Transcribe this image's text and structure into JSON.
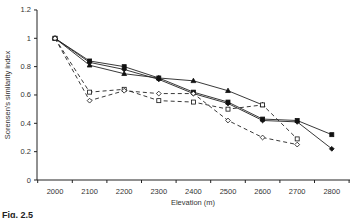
{
  "chart_data": {
    "type": "line",
    "title": "",
    "xlabel": "Elevation (m)",
    "ylabel": "Sorensen's similarity index",
    "x": [
      2000,
      2100,
      2200,
      2300,
      2400,
      2500,
      2600,
      2700,
      2800
    ],
    "xticks": [
      "2000",
      "2100",
      "2200",
      "2300",
      "2400",
      "2500",
      "2600",
      "2700",
      "2800"
    ],
    "yticks": [
      "0",
      "0.2",
      "0.4",
      "0.6",
      "0.8",
      "1",
      "1.2"
    ],
    "ylim": [
      0,
      1.2
    ],
    "grid": false,
    "legend": "none",
    "series": [
      {
        "name": "filled-square",
        "marker": "square",
        "filled": true,
        "dashed": false,
        "values": [
          1.0,
          0.84,
          0.8,
          0.72,
          0.62,
          0.55,
          0.43,
          0.42,
          0.32
        ]
      },
      {
        "name": "filled-diamond",
        "marker": "diamond",
        "filled": true,
        "dashed": false,
        "values": [
          1.0,
          0.83,
          0.78,
          0.71,
          0.61,
          0.54,
          0.42,
          0.41,
          0.22
        ]
      },
      {
        "name": "filled-triangle",
        "marker": "triangle",
        "filled": true,
        "dashed": false,
        "values": [
          1.0,
          0.81,
          0.75,
          0.72,
          0.7,
          0.63,
          0.53,
          null,
          null
        ]
      },
      {
        "name": "open-square",
        "marker": "square",
        "filled": false,
        "dashed": true,
        "values": [
          1.0,
          0.62,
          0.64,
          0.56,
          0.55,
          0.5,
          0.53,
          0.29,
          null
        ]
      },
      {
        "name": "open-diamond",
        "marker": "diamond",
        "filled": false,
        "dashed": true,
        "values": [
          1.0,
          0.56,
          0.63,
          0.61,
          0.61,
          0.42,
          0.3,
          0.25,
          null
        ]
      }
    ]
  },
  "caption": "Fig. 2.5"
}
